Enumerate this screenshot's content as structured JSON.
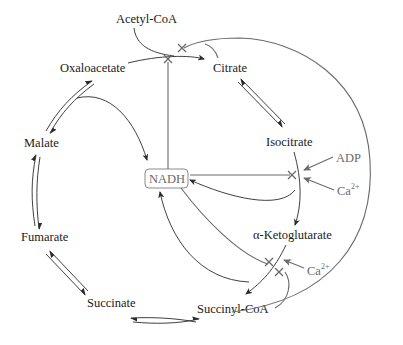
{
  "diagram": {
    "metabolites": {
      "acetyl_coa": "Acetyl-CoA",
      "oxaloacetate": "Oxaloacetate",
      "citrate": "Citrate",
      "isocitrate": "Isocitrate",
      "alpha_ketoglutarate": "α-Ketoglutarate",
      "succinyl_coa": "Succinyl-CoA",
      "succinate": "Succinate",
      "fumarate": "Fumarate",
      "malate": "Malate"
    },
    "regulators": {
      "nadh": "NADH",
      "adp": "ADP",
      "ca_base": "Ca",
      "ca_charge": "2+"
    },
    "colors": {
      "pathway": "#2a2a2a",
      "regulation": "#6a6a6a"
    },
    "inhibition_symbol": "×",
    "legend_semantics": {
      "x_mark": "inhibition",
      "gray_arrow": "activation"
    }
  }
}
